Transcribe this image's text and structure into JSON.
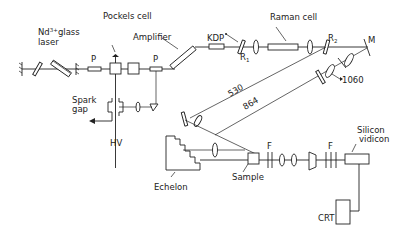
{
  "diagram": {
    "type": "optical-setup",
    "labels": {
      "laser_line1": "Nd",
      "laser_sup": "3+",
      "laser_line1b": "glass",
      "laser_line2": "laser",
      "pockels": "Pockels cell",
      "amplifier": "Amplifier",
      "polarizer_1": "P",
      "polarizer_2": "P",
      "kdp": "KDP",
      "raman": "Raman cell",
      "r1": "R",
      "r1_sub": "1",
      "r2": "R",
      "r2_sub": "2",
      "mirror": "M",
      "beam_1060": "1060",
      "beam_530": "530",
      "beam_864": "864",
      "spark_1": "Spark",
      "spark_2": "gap",
      "hv": "HV",
      "echelon": "Echelon",
      "sample": "Sample",
      "filter_1": "F",
      "filter_2": "F",
      "vidicon_1": "Silicon",
      "vidicon_2": "vidicon",
      "crt": "CRT"
    }
  }
}
